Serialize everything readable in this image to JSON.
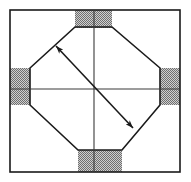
{
  "canvas": {
    "width": 191,
    "height": 182,
    "background_color": "#ffffff",
    "title": "Square with inscribed octagon and diagonal dimension arrow"
  },
  "colors": {
    "stroke": "#1a1a1a",
    "shade_dark": "#7d7d7d",
    "shade_light": "#c8c8c8",
    "background": "#ffffff"
  },
  "figure": {
    "type": "geometric-diagram",
    "outer_square": {
      "name": "outer-square",
      "x": 10,
      "y": 10,
      "width": 170,
      "height": 162,
      "stroke_width": 1.6
    },
    "octagon": {
      "name": "inscribed-octagon",
      "stroke_width": 1.6,
      "points": [
        [
          75,
          27
        ],
        [
          112,
          27
        ],
        [
          160,
          68
        ],
        [
          160,
          105
        ],
        [
          122,
          150
        ],
        [
          78,
          150
        ],
        [
          30,
          105
        ],
        [
          30,
          68
        ]
      ]
    },
    "center_lines": {
      "horizontal": {
        "name": "horizontal-center-line",
        "x1": 10,
        "y1": 89,
        "x2": 180,
        "y2": 89,
        "stroke_width": 1.1
      },
      "vertical": {
        "name": "vertical-center-line",
        "x1": 94,
        "y1": 10,
        "x2": 94,
        "y2": 172,
        "stroke_width": 1.1
      }
    },
    "dimension_arrow": {
      "name": "diagonal-dimension-arrow",
      "x1": 56,
      "y1": 46,
      "x2": 133,
      "y2": 128,
      "stroke_width": 1.6,
      "double_headed": true,
      "head_length": 11,
      "head_width": 7
    },
    "shaded_rectangles": [
      {
        "name": "shaded-rect-top",
        "x": 75,
        "y": 10,
        "width": 37,
        "height": 18
      },
      {
        "name": "shaded-rect-bottom",
        "x": 78,
        "y": 150,
        "width": 44,
        "height": 22
      },
      {
        "name": "shaded-rect-left",
        "x": 10,
        "y": 68,
        "width": 20,
        "height": 37
      },
      {
        "name": "shaded-rect-right",
        "x": 160,
        "y": 68,
        "width": 20,
        "height": 37
      }
    ]
  }
}
